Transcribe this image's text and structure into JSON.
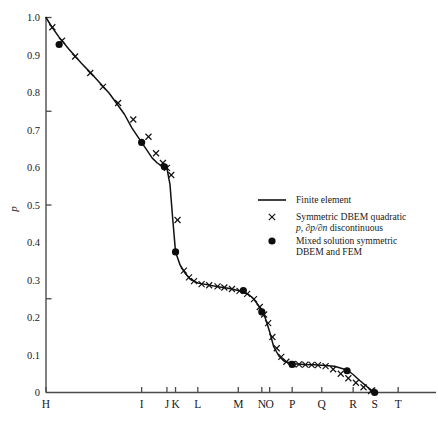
{
  "chart_data": {
    "type": "line",
    "title": "",
    "xlabel": "",
    "ylabel": "p",
    "ylim": [
      0,
      1.0
    ],
    "grid": false,
    "y_ticks_major": [
      "0",
      "0.1",
      "0.2",
      "0.3",
      "0.4",
      "0.5",
      "0.6",
      "0.7",
      "0.8",
      "0.9",
      "1.0"
    ],
    "y_ticks_minor": [
      0.25,
      0.5,
      0.75
    ],
    "x_tick_labels": [
      "H",
      "I",
      "J",
      "K",
      "L",
      "M",
      "N",
      "O",
      "P",
      "Q",
      "R",
      "S",
      "T"
    ],
    "x_tick_positions": [
      0.0,
      0.378,
      0.478,
      0.512,
      0.6,
      0.76,
      0.853,
      0.884,
      0.973,
      1.09,
      1.214,
      1.299,
      1.392
    ],
    "legend_position": "center-right",
    "series": [
      {
        "name": "Finite element",
        "marker": "line",
        "x": [
          0.0,
          0.02,
          0.05,
          0.09,
          0.14,
          0.19,
          0.25,
          0.31,
          0.34,
          0.378,
          0.4,
          0.42,
          0.44,
          0.455,
          0.468,
          0.478,
          0.49,
          0.5,
          0.512,
          0.53,
          0.55,
          0.57,
          0.6,
          0.64,
          0.68,
          0.72,
          0.76,
          0.8,
          0.82,
          0.84,
          0.853,
          0.866,
          0.884,
          0.9,
          0.92,
          0.94,
          0.973,
          1.02,
          1.06,
          1.09,
          1.14,
          1.19,
          1.214,
          1.24,
          1.27,
          1.299
        ],
        "y": [
          1.0,
          0.978,
          0.949,
          0.916,
          0.878,
          0.843,
          0.798,
          0.742,
          0.705,
          0.667,
          0.645,
          0.625,
          0.612,
          0.605,
          0.6,
          0.598,
          0.555,
          0.47,
          0.375,
          0.34,
          0.318,
          0.302,
          0.292,
          0.287,
          0.282,
          0.278,
          0.272,
          0.262,
          0.25,
          0.232,
          0.215,
          0.2,
          0.162,
          0.122,
          0.098,
          0.084,
          0.077,
          0.075,
          0.074,
          0.073,
          0.07,
          0.06,
          0.048,
          0.032,
          0.015,
          0.0
        ]
      },
      {
        "name": "Symmetric DBEM quadratic p, ∂p/∂n discontinuous",
        "marker": "x",
        "x": [
          0.025,
          0.063,
          0.115,
          0.175,
          0.225,
          0.285,
          0.345,
          0.405,
          0.435,
          0.462,
          0.478,
          0.495,
          0.52,
          0.545,
          0.565,
          0.585,
          0.615,
          0.645,
          0.678,
          0.705,
          0.735,
          0.765,
          0.795,
          0.822,
          0.845,
          0.862,
          0.878,
          0.895,
          0.912,
          0.93,
          0.95,
          0.975,
          1.0,
          1.025,
          1.05,
          1.075,
          1.105,
          1.135,
          1.165,
          1.195,
          1.225,
          1.255,
          1.285
        ],
        "y": [
          0.974,
          0.938,
          0.896,
          0.852,
          0.815,
          0.772,
          0.728,
          0.682,
          0.638,
          0.612,
          0.599,
          0.58,
          0.46,
          0.325,
          0.307,
          0.297,
          0.289,
          0.286,
          0.283,
          0.28,
          0.276,
          0.271,
          0.263,
          0.249,
          0.228,
          0.208,
          0.185,
          0.148,
          0.118,
          0.095,
          0.082,
          0.076,
          0.0748,
          0.0742,
          0.0736,
          0.0728,
          0.0705,
          0.062,
          0.05,
          0.038,
          0.026,
          0.014,
          0.004
        ]
      },
      {
        "name": "Mixed solution symmetric DBEM and FEM",
        "marker": "dot",
        "x": [
          0.052,
          0.378,
          0.468,
          0.512,
          0.78,
          0.853,
          0.973,
          1.19,
          1.299
        ],
        "y": [
          0.928,
          0.667,
          0.602,
          0.375,
          0.272,
          0.215,
          0.075,
          0.058,
          0.0
        ]
      }
    ]
  },
  "legend": {
    "entries": [
      {
        "marker": "line",
        "lines": [
          {
            "segments": [
              {
                "text": "Finite element",
                "italic": false
              }
            ]
          }
        ]
      },
      {
        "marker": "x",
        "lines": [
          {
            "segments": [
              {
                "text": "Symmetric DBEM quadratic",
                "italic": false
              }
            ]
          },
          {
            "segments": [
              {
                "text": "p",
                "italic": true
              },
              {
                "text": ", ",
                "italic": false
              },
              {
                "text": "∂p/∂n",
                "italic": true
              },
              {
                "text": " discontinuous",
                "italic": false
              }
            ]
          }
        ]
      },
      {
        "marker": "dot",
        "lines": [
          {
            "segments": [
              {
                "text": "Mixed solution symmetric",
                "italic": false
              }
            ]
          },
          {
            "segments": [
              {
                "text": "DBEM and FEM",
                "italic": false
              }
            ]
          }
        ]
      }
    ]
  }
}
